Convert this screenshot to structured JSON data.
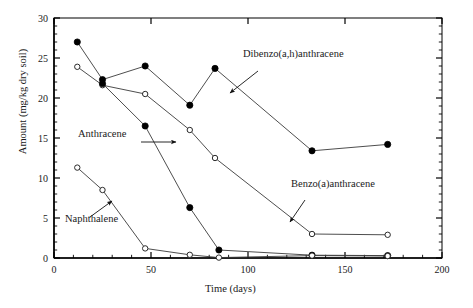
{
  "chart_data": {
    "type": "line",
    "title": "",
    "xlabel": "Time (days)",
    "ylabel": "Amount (mg/kg dry soil)",
    "xlim": [
      0,
      200
    ],
    "ylim": [
      0,
      30
    ],
    "xticks": [
      0,
      50,
      100,
      150,
      200
    ],
    "yticks": [
      0,
      5,
      10,
      15,
      20,
      25,
      30
    ],
    "xtick_labels": [
      "0",
      "50",
      "100",
      "150",
      "200"
    ],
    "ytick_labels": [
      "0",
      "5",
      "10",
      "15",
      "20",
      "25",
      "30"
    ],
    "x_minor_tick_step": 10,
    "y_minor_tick_step": 1,
    "grid": false,
    "legend_position": "inline-annotations",
    "series": [
      {
        "name": "Dibenzo(a,h)anthracene",
        "marker": "filled-circle",
        "x": [
          12,
          25,
          47,
          70,
          83,
          133,
          172
        ],
        "y": [
          27.0,
          22.3,
          24.0,
          19.1,
          23.7,
          13.4,
          14.2
        ]
      },
      {
        "name": "Benzo(a)anthracene",
        "marker": "open-circle",
        "x": [
          12,
          25,
          47,
          70,
          83,
          133,
          172
        ],
        "y": [
          23.9,
          21.6,
          20.5,
          16.0,
          12.5,
          3.0,
          2.9
        ]
      },
      {
        "name": "Anthracene",
        "marker": "filled-circle",
        "x": [
          25,
          47,
          70,
          85,
          133,
          172
        ],
        "y": [
          21.8,
          16.5,
          6.3,
          1.0,
          0.35,
          0.3
        ]
      },
      {
        "name": "Naphthalene",
        "marker": "open-circle",
        "x": [
          12,
          25,
          47,
          70,
          85,
          133,
          172
        ],
        "y": [
          11.3,
          8.5,
          1.2,
          0.4,
          0.05,
          0.3,
          0.25
        ]
      }
    ],
    "annotations": [
      {
        "name": "Dibenzo(a,h)anthracene",
        "text": "Dibenzo(a,h)anthracene",
        "label_x": 243,
        "label_y": 57,
        "arrow_from_x": 258,
        "arrow_from_y": 71,
        "arrow_to_x": 230,
        "arrow_to_y": 93
      },
      {
        "name": "Benzo(a)anthracene",
        "text": "Benzo(a)anthracene",
        "label_x": 291,
        "label_y": 187,
        "arrow_from_x": 305,
        "arrow_from_y": 200,
        "arrow_to_x": 290,
        "arrow_to_y": 222
      },
      {
        "name": "Anthracene",
        "text": "Anthracene",
        "label_x": 78,
        "label_y": 137,
        "arrow_from_x": 141,
        "arrow_from_y": 142,
        "arrow_to_x": 176,
        "arrow_to_y": 142
      },
      {
        "name": "Naphthalene",
        "text": "Naphthalene",
        "label_x": 65,
        "label_y": 222,
        "arrow_from_x": 90,
        "arrow_from_y": 217,
        "arrow_to_x": 112,
        "arrow_to_y": 201
      }
    ],
    "colors": {
      "line": "#3a3a3a",
      "marker_fill": "#000000",
      "marker_open_fill": "#ffffff",
      "axis": "#000000",
      "text": "#1a1a1a",
      "background": "#ffffff"
    },
    "plot_box": {
      "left": 54,
      "right": 442,
      "top": 18,
      "bottom": 258
    }
  }
}
